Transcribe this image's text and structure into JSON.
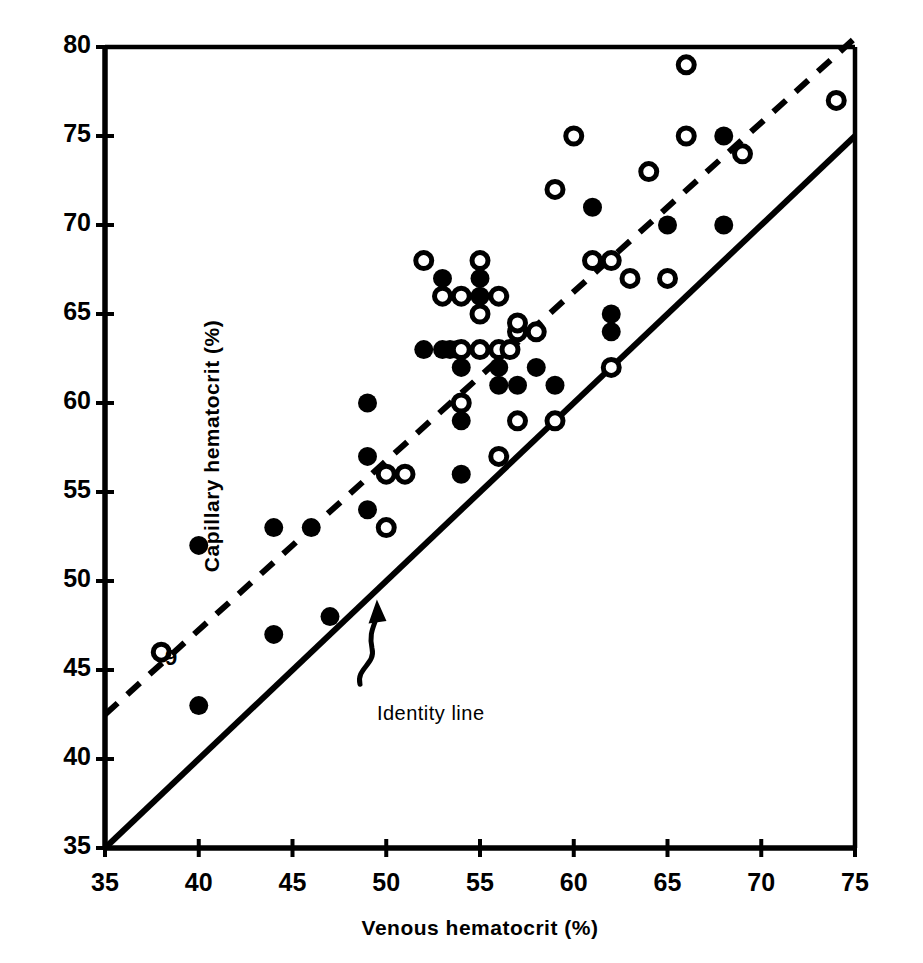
{
  "figure": {
    "background_color": "#ffffff",
    "ink_color": "#000000"
  },
  "chart_data": {
    "type": "scatter",
    "title": "",
    "xlabel": "Venous hematocrit (%)",
    "ylabel": "Capillary hematocrit (%)",
    "xlim": [
      35,
      75
    ],
    "ylim": [
      35,
      80
    ],
    "xticks": [
      35,
      40,
      45,
      50,
      55,
      60,
      65,
      70,
      75
    ],
    "yticks": [
      35,
      40,
      45,
      50,
      55,
      60,
      65,
      70,
      75,
      80
    ],
    "xtick_labels": [
      "35",
      "40",
      "45",
      "50",
      "55",
      "60",
      "65",
      "70",
      "75"
    ],
    "ytick_labels": [
      "35",
      "40",
      "45",
      "50",
      "55",
      "60",
      "65",
      "70",
      "75",
      "80"
    ],
    "grid": false,
    "legend_position": "none",
    "series": [
      {
        "name": "filled-marker-group",
        "marker": "filled-circle",
        "marker_color": "#000000",
        "points": [
          [
            40,
            52
          ],
          [
            40,
            43
          ],
          [
            44,
            53
          ],
          [
            44,
            47
          ],
          [
            46,
            53
          ],
          [
            47,
            48
          ],
          [
            49,
            60
          ],
          [
            49,
            57
          ],
          [
            49,
            54
          ],
          [
            51,
            56
          ],
          [
            52,
            63
          ],
          [
            53,
            63
          ],
          [
            53.4,
            63
          ],
          [
            53.8,
            63
          ],
          [
            53,
            67
          ],
          [
            54,
            56
          ],
          [
            54,
            59
          ],
          [
            54,
            62
          ],
          [
            55,
            67
          ],
          [
            55,
            66
          ],
          [
            55,
            65
          ],
          [
            56,
            63
          ],
          [
            56,
            61
          ],
          [
            56,
            62
          ],
          [
            57,
            61
          ],
          [
            58,
            62
          ],
          [
            59,
            61
          ],
          [
            61,
            71
          ],
          [
            61,
            68
          ],
          [
            62,
            65
          ],
          [
            62,
            64
          ],
          [
            62,
            62
          ],
          [
            65,
            70
          ],
          [
            66,
            75
          ],
          [
            68,
            75
          ],
          [
            68,
            70
          ]
        ]
      },
      {
        "name": "open-marker-group",
        "marker": "open-circle",
        "marker_color": "#000000",
        "points": [
          [
            38,
            46
          ],
          [
            50,
            56
          ],
          [
            50,
            53
          ],
          [
            51,
            56
          ],
          [
            52,
            68
          ],
          [
            53,
            66
          ],
          [
            54,
            66
          ],
          [
            54,
            63
          ],
          [
            54,
            60
          ],
          [
            55,
            68
          ],
          [
            55,
            65
          ],
          [
            55,
            63
          ],
          [
            56,
            66
          ],
          [
            56,
            63
          ],
          [
            56,
            57
          ],
          [
            56.6,
            63
          ],
          [
            57,
            64
          ],
          [
            57,
            59
          ],
          [
            57,
            64.5
          ],
          [
            58,
            64
          ],
          [
            59,
            59
          ],
          [
            60,
            75
          ],
          [
            59,
            72
          ],
          [
            61,
            68
          ],
          [
            62,
            68
          ],
          [
            62,
            62
          ],
          [
            63,
            67
          ],
          [
            64,
            73
          ],
          [
            65,
            67
          ],
          [
            66,
            79
          ],
          [
            66,
            75
          ],
          [
            69,
            74
          ],
          [
            74,
            77
          ]
        ]
      }
    ],
    "reference_lines": [
      {
        "name": "identity-line",
        "style": "solid",
        "label": "Identity line",
        "from": [
          35,
          35
        ],
        "to": [
          75,
          75
        ]
      },
      {
        "name": "regression-line",
        "style": "dashed",
        "label": "",
        "from": [
          35,
          42.5
        ],
        "to": [
          75,
          80.5
        ]
      }
    ],
    "annotations": [
      {
        "name": "identity-line-annotation",
        "text": "Identity line",
        "x": 49.5,
        "y": 43.2
      },
      {
        "name": "slope-marking",
        "text": "9",
        "x": 38.2,
        "y": 46.4
      }
    ]
  }
}
